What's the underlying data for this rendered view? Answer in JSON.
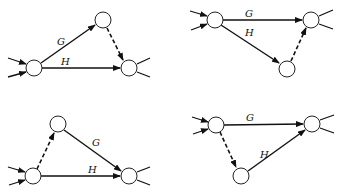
{
  "diagram": {
    "labels": {
      "g": "G",
      "h": "H"
    },
    "panels": [
      {
        "id": "top-left",
        "nodes": [
          {
            "id": "start",
            "x": 34,
            "y": 68
          },
          {
            "id": "mid",
            "x": 103,
            "y": 20
          },
          {
            "id": "end",
            "x": 129,
            "y": 68
          }
        ],
        "edges": [
          {
            "from": "start",
            "to": "mid",
            "label": "G",
            "style": "solid"
          },
          {
            "from": "start",
            "to": "end",
            "label": "H",
            "style": "solid"
          },
          {
            "from": "mid",
            "to": "end",
            "label": "",
            "style": "dashed"
          }
        ]
      },
      {
        "id": "top-right",
        "nodes": [
          {
            "id": "start",
            "x": 215,
            "y": 20
          },
          {
            "id": "end",
            "x": 311,
            "y": 20
          },
          {
            "id": "mid",
            "x": 287,
            "y": 69
          }
        ],
        "edges": [
          {
            "from": "start",
            "to": "end",
            "label": "G",
            "style": "solid"
          },
          {
            "from": "start",
            "to": "mid",
            "label": "H",
            "style": "solid"
          },
          {
            "from": "mid",
            "to": "end",
            "label": "",
            "style": "dashed"
          }
        ]
      },
      {
        "id": "bottom-left",
        "nodes": [
          {
            "id": "start",
            "x": 33,
            "y": 176
          },
          {
            "id": "mid",
            "x": 58,
            "y": 124
          },
          {
            "id": "end",
            "x": 129,
            "y": 176
          }
        ],
        "edges": [
          {
            "from": "start",
            "to": "mid",
            "label": "",
            "style": "dashed"
          },
          {
            "from": "mid",
            "to": "end",
            "label": "G",
            "style": "solid"
          },
          {
            "from": "start",
            "to": "end",
            "label": "H",
            "style": "solid"
          }
        ]
      },
      {
        "id": "bottom-right",
        "nodes": [
          {
            "id": "start",
            "x": 216,
            "y": 125
          },
          {
            "id": "end",
            "x": 312,
            "y": 124
          },
          {
            "id": "mid",
            "x": 241,
            "y": 176
          }
        ],
        "edges": [
          {
            "from": "start",
            "to": "end",
            "label": "G",
            "style": "solid"
          },
          {
            "from": "start",
            "to": "mid",
            "label": "",
            "style": "dashed"
          },
          {
            "from": "mid",
            "to": "end",
            "label": "H",
            "style": "solid"
          }
        ]
      }
    ]
  }
}
